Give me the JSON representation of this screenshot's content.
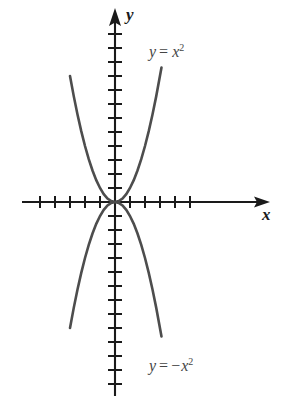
{
  "figure": {
    "background_color": "#ffffff",
    "axis_color": "#1a1a1a",
    "curve_color": "#4d4d4d",
    "label_color": "#454545"
  },
  "axes": {
    "x_axis_label": "x",
    "y_axis_label": "y",
    "origin": {
      "x": 115,
      "y": 202
    },
    "x_tick_count_left": 5,
    "x_tick_count_right": 5,
    "y_tick_count_up": 13,
    "y_tick_count_down": 13,
    "x_tick_spacing": 15,
    "y_tick_spacing": 14,
    "x_tick_half_length": 6,
    "y_tick_half_length": 7,
    "x_axis_start": 22,
    "x_axis_end": 270,
    "y_axis_top": 8,
    "y_axis_bottom": 396
  },
  "labels": {
    "upper_curve": {
      "lhs": "y",
      "operator": "=",
      "rhs_base": "x",
      "rhs_exponent": "2",
      "minus": "",
      "text": "y = x2"
    },
    "lower_curve": {
      "lhs": "y",
      "operator": "=",
      "rhs_base": "x",
      "rhs_exponent": "2",
      "minus": "−",
      "text": "y = −x2"
    }
  },
  "chart_data": {
    "type": "line",
    "title": "",
    "xlabel": "x",
    "ylabel": "y",
    "grid": false,
    "legend": "annotation",
    "xlim": [
      -5.9,
      5.9
    ],
    "ylim": [
      -13.8,
      13.8
    ],
    "x_axis_tick_values": [
      -5,
      -4,
      -3,
      -2,
      -1,
      1,
      2,
      3,
      4,
      5
    ],
    "y_axis_tick_values": [
      -13,
      -12,
      -11,
      -10,
      -9,
      -8,
      -7,
      -6,
      -5,
      -4,
      -3,
      -2,
      -1,
      1,
      2,
      3,
      4,
      5,
      6,
      7,
      8,
      9,
      10,
      11,
      12,
      13
    ],
    "series": [
      {
        "name": "y = x^2",
        "color": "#4d4d4d",
        "equation": "y = x^2",
        "x": [
          -3.0,
          -2.75,
          -2.5,
          -2.25,
          -2.0,
          -1.75,
          -1.5,
          -1.25,
          -1.0,
          -0.75,
          -0.5,
          -0.25,
          0,
          0.25,
          0.5,
          0.75,
          1.0,
          1.25,
          1.5,
          1.75,
          2.0,
          2.25,
          2.5,
          2.75,
          3.1
        ],
        "values": [
          9.0,
          7.5625,
          6.25,
          5.0625,
          4.0,
          3.0625,
          2.25,
          1.5625,
          1.0,
          0.5625,
          0.25,
          0.0625,
          0,
          0.0625,
          0.25,
          0.5625,
          1.0,
          1.5625,
          2.25,
          3.0625,
          4.0,
          5.0625,
          6.25,
          7.5625,
          9.61
        ]
      },
      {
        "name": "y = -x^2",
        "color": "#4d4d4d",
        "equation": "y = -x^2",
        "x": [
          -3.0,
          -2.75,
          -2.5,
          -2.25,
          -2.0,
          -1.75,
          -1.5,
          -1.25,
          -1.0,
          -0.75,
          -0.5,
          -0.25,
          0,
          0.25,
          0.5,
          0.75,
          1.0,
          1.25,
          1.5,
          1.75,
          2.0,
          2.25,
          2.5,
          2.75,
          3.1
        ],
        "values": [
          -9.0,
          -7.5625,
          -6.25,
          -5.0625,
          -4.0,
          -3.0625,
          -2.25,
          -1.5625,
          -1.0,
          -0.5625,
          -0.25,
          -0.0625,
          0,
          -0.0625,
          -0.25,
          -0.5625,
          -1.0,
          -1.5625,
          -2.25,
          -3.0625,
          -4.0,
          -5.0625,
          -6.25,
          -7.5625,
          -9.61
        ]
      }
    ],
    "annotations": [
      {
        "text": "y = x2",
        "x": 3.3,
        "y": 11.5
      },
      {
        "text": "y = −x2",
        "x": 3.3,
        "y": -11.8
      }
    ]
  }
}
